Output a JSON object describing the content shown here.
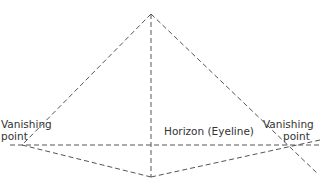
{
  "diagram": {
    "type": "two-point perspective",
    "colors": {
      "line": "#555555",
      "text": "#333333",
      "background": "#ffffff"
    },
    "labels": {
      "left_vp_line1": "Vanishing",
      "left_vp_line2": "point",
      "right_vp_line1": "Vanishing",
      "right_vp_line2": "point",
      "horizon": "Horizon (Eyeline)"
    },
    "points": {
      "apex": [
        151,
        14
      ],
      "bottom": [
        151,
        177
      ],
      "left_vp": [
        22,
        145
      ],
      "right_vp": [
        300,
        145
      ]
    }
  }
}
